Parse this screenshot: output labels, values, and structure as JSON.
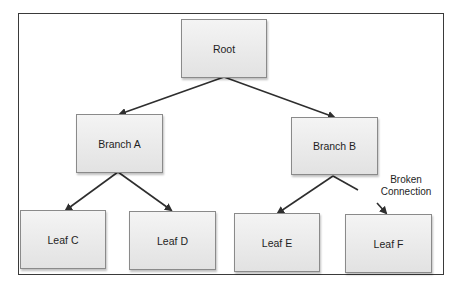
{
  "diagram": {
    "type": "tree",
    "frame": {
      "x": 18,
      "y": 13,
      "w": 426,
      "h": 262
    },
    "nodes": [
      {
        "id": "root",
        "label": "Root",
        "x": 181,
        "y": 19,
        "w": 86,
        "h": 59
      },
      {
        "id": "branch_a",
        "label": "Branch A",
        "x": 76,
        "y": 114,
        "w": 87,
        "h": 59
      },
      {
        "id": "branch_b",
        "label": "Branch B",
        "x": 291,
        "y": 117,
        "w": 87,
        "h": 58
      },
      {
        "id": "leaf_c",
        "label": "Leaf C",
        "x": 20,
        "y": 210,
        "w": 86,
        "h": 59
      },
      {
        "id": "leaf_d",
        "label": "Leaf D",
        "x": 129,
        "y": 211,
        "w": 87,
        "h": 59
      },
      {
        "id": "leaf_e",
        "label": "Leaf E",
        "x": 234,
        "y": 213,
        "w": 86,
        "h": 59
      },
      {
        "id": "leaf_f",
        "label": "Leaf F",
        "x": 345,
        "y": 214,
        "w": 87,
        "h": 59
      }
    ],
    "edges": [
      {
        "from": "root",
        "to": "branch_a",
        "x1": 224,
        "y1": 77,
        "x2": 120,
        "y2": 114,
        "arrow": true
      },
      {
        "from": "root",
        "to": "branch_b",
        "x1": 224,
        "y1": 77,
        "x2": 334,
        "y2": 117,
        "arrow": true
      },
      {
        "from": "branch_a",
        "to": "leaf_c",
        "x1": 118,
        "y1": 172,
        "x2": 66,
        "y2": 210,
        "arrow": true
      },
      {
        "from": "branch_a",
        "to": "leaf_d",
        "x1": 118,
        "y1": 172,
        "x2": 171,
        "y2": 210,
        "arrow": true
      },
      {
        "from": "branch_b",
        "to": "leaf_e",
        "x1": 333,
        "y1": 176,
        "x2": 278,
        "y2": 213,
        "arrow": true
      },
      {
        "from": "branch_b",
        "to": "broken",
        "x1": 333,
        "y1": 176,
        "x2": 358,
        "y2": 190,
        "arrow": false
      },
      {
        "from": "broken",
        "to": "leaf_f",
        "x1": 377,
        "y1": 203,
        "x2": 386,
        "y2": 213,
        "arrow": true
      }
    ],
    "annotation": {
      "line1": "Broken",
      "line2": "Connection",
      "x": 378,
      "y": 174,
      "w": 56
    },
    "colors": {
      "line": "#2e2e2e",
      "frame": "#3a3a3a",
      "node_fill_top": "#f4f4f4",
      "node_fill_bottom": "#e2e2e2",
      "node_border": "#8a8a8a"
    }
  }
}
